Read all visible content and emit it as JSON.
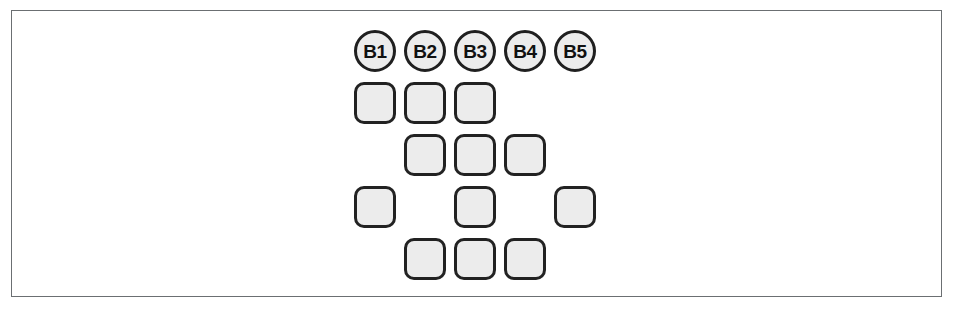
{
  "figure": {
    "frame": {
      "visible": true,
      "border_color": "#6b6f72"
    },
    "geometry": {
      "column_origin_x": 354,
      "column_pitch": 50,
      "header_y": 30,
      "row_origin_y": 82,
      "row_pitch": 52,
      "node_size": 42
    },
    "palette": {
      "node_fill": "#ececec",
      "node_stroke": "#222222",
      "circle_stroke": "#1f1f1f",
      "label_color": "#111111",
      "frame_stroke": "#6b6f72",
      "background": "#ffffff"
    }
  },
  "chart_data": {
    "type": "heatmap",
    "title": "",
    "xlabel": "",
    "ylabel": "",
    "columns": [
      "B1",
      "B2",
      "B3",
      "B4",
      "B5"
    ],
    "rows": [
      "1",
      "2",
      "3",
      "4"
    ],
    "legend": [],
    "grid": false,
    "matrix": [
      [
        1,
        1,
        1,
        0,
        0
      ],
      [
        0,
        1,
        1,
        1,
        0
      ],
      [
        1,
        0,
        1,
        0,
        1
      ],
      [
        0,
        1,
        1,
        1,
        0
      ]
    ],
    "column_totals": [
      2,
      3,
      4,
      2,
      1
    ],
    "row_totals": [
      3,
      3,
      3,
      3
    ],
    "total_squares": 12
  },
  "header_nodes": [
    {
      "id": "b1",
      "label": "B1",
      "column": 0
    },
    {
      "id": "b2",
      "label": "B2",
      "column": 1
    },
    {
      "id": "b3",
      "label": "B3",
      "column": 2
    },
    {
      "id": "b4",
      "label": "B4",
      "column": 3
    },
    {
      "id": "b5",
      "label": "B5",
      "column": 4
    }
  ],
  "grid_rows": [
    {
      "row": 0,
      "filled_columns": [
        0,
        1,
        2
      ]
    },
    {
      "row": 1,
      "filled_columns": [
        1,
        2,
        3
      ]
    },
    {
      "row": 2,
      "filled_columns": [
        0,
        2,
        4
      ]
    },
    {
      "row": 3,
      "filled_columns": [
        1,
        2,
        3
      ]
    }
  ]
}
